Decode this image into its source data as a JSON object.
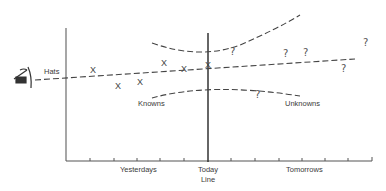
{
  "diagram": {
    "type": "forecast-uncertainty-funnel",
    "eye_symbol": "eye-icon",
    "labels": {
      "trend": "Hats",
      "knowns": "Knowns",
      "unknowns": "Unknowns",
      "past_axis": "Yesterdays",
      "today_line_1": "Today",
      "today_line_2": "Line",
      "future_axis": "Tomorrows"
    },
    "known_marker": "X",
    "unknown_marker": "?",
    "known_points": [
      {
        "x": 93,
        "y": 71
      },
      {
        "x": 118,
        "y": 87
      },
      {
        "x": 140,
        "y": 83
      },
      {
        "x": 164,
        "y": 64
      },
      {
        "x": 184,
        "y": 70
      },
      {
        "x": 209,
        "y": 66
      }
    ],
    "unknown_points": [
      {
        "x": 233,
        "y": 52
      },
      {
        "x": 286,
        "y": 54
      },
      {
        "x": 306,
        "y": 53
      },
      {
        "x": 344,
        "y": 69
      },
      {
        "x": 366,
        "y": 43
      },
      {
        "x": 258,
        "y": 95
      }
    ],
    "colors": {
      "line": "#444444",
      "background": "#ffffff"
    }
  }
}
